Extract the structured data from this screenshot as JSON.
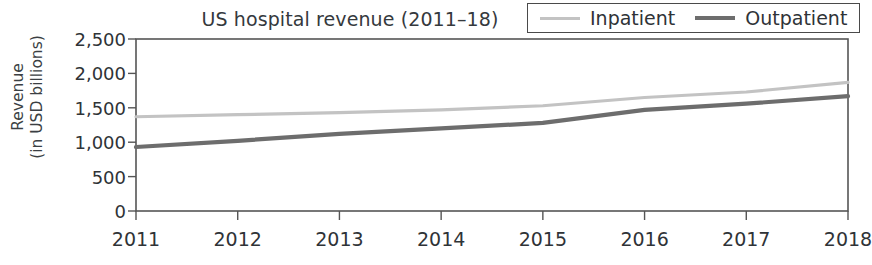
{
  "chart_data": {
    "type": "line",
    "title": "US hospital revenue (2011–18)",
    "xlabel": "",
    "ylabel_line1": "Revenue",
    "ylabel_line2": "(in USD billions)",
    "categories": [
      "2011",
      "2012",
      "2013",
      "2014",
      "2015",
      "2016",
      "2017",
      "2018"
    ],
    "x": [
      2011,
      2012,
      2013,
      2014,
      2015,
      2016,
      2017,
      2018
    ],
    "series": [
      {
        "name": "Inpatient",
        "color": "#c3c3c3",
        "values": [
          1370,
          1400,
          1430,
          1470,
          1530,
          1650,
          1730,
          1870
        ]
      },
      {
        "name": "Outpatient",
        "color": "#6d6d6d",
        "values": [
          930,
          1020,
          1120,
          1200,
          1280,
          1470,
          1560,
          1670
        ]
      }
    ],
    "ylim": [
      0,
      2500
    ],
    "yticks": [
      0,
      500,
      1000,
      1500,
      2000,
      2500
    ],
    "ytick_labels": [
      "0",
      "500",
      "1,000",
      "1,500",
      "2,000",
      "2,500"
    ],
    "grid": false,
    "legend_position": "top-right",
    "legend_entries": [
      "Inpatient",
      "Outpatient"
    ]
  },
  "legend": {
    "inpatient_label": "Inpatient",
    "outpatient_label": "Outpatient"
  }
}
